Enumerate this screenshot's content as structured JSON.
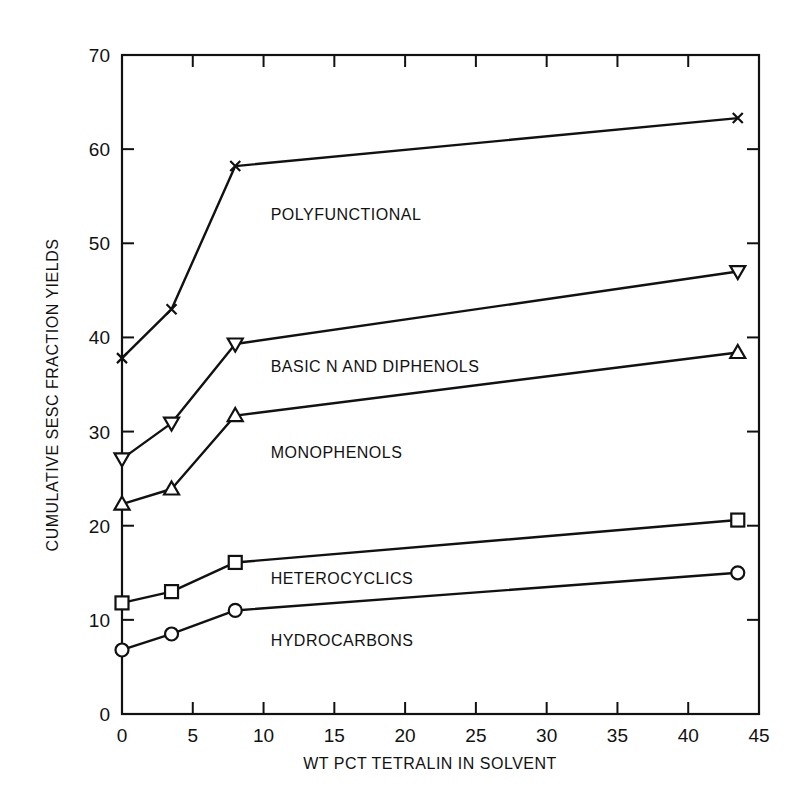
{
  "chart_data": {
    "type": "line",
    "title": "",
    "xlabel": "WT PCT TETRALIN IN SOLVENT",
    "ylabel": "CUMULATIVE SESC FRACTION YIELDS",
    "xlim": [
      0,
      45
    ],
    "ylim": [
      0,
      70
    ],
    "xticks": [
      0,
      5,
      10,
      15,
      20,
      25,
      30,
      35,
      40,
      45
    ],
    "yticks": [
      0,
      10,
      20,
      30,
      40,
      50,
      60,
      70
    ],
    "grid": false,
    "legend": "inline labels",
    "x": [
      0,
      3.5,
      8,
      43.5
    ],
    "series": [
      {
        "name": "POLYFUNCTIONAL",
        "marker": "x",
        "values": [
          37.8,
          43.0,
          58.2,
          63.3
        ]
      },
      {
        "name": "BASIC N AND DIPHENOLS",
        "marker": "triangle-down",
        "values": [
          27.1,
          30.9,
          39.3,
          47.0
        ]
      },
      {
        "name": "MONOPHENOLS",
        "marker": "triangle-up",
        "values": [
          22.3,
          23.9,
          31.7,
          38.4
        ]
      },
      {
        "name": "HETEROCYCLICS",
        "marker": "square",
        "values": [
          11.8,
          13.0,
          16.1,
          20.6
        ]
      },
      {
        "name": "HYDROCARBONS",
        "marker": "circle",
        "values": [
          6.8,
          8.5,
          11.0,
          15.0
        ]
      }
    ],
    "annotations": [
      {
        "text": "POLYFUNCTIONAL",
        "x": 10.5,
        "y": 52.5
      },
      {
        "text": "BASIC N AND DIPHENOLS",
        "x": 10.5,
        "y": 36.3
      },
      {
        "text": "MONOPHENOLS",
        "x": 10.5,
        "y": 27.2
      },
      {
        "text": "HETEROCYCLICS",
        "x": 10.5,
        "y": 13.8
      },
      {
        "text": "HYDROCARBONS",
        "x": 10.5,
        "y": 7.2
      }
    ]
  }
}
